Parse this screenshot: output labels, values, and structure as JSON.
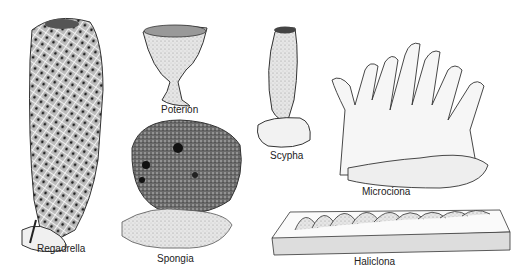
{
  "figure": {
    "specimens": [
      {
        "id": "regadrella",
        "label": "Regadrella"
      },
      {
        "id": "poterion",
        "label": "Poterion"
      },
      {
        "id": "spongia",
        "label": "Spongia"
      },
      {
        "id": "scypha",
        "label": "Scypha"
      },
      {
        "id": "microciona",
        "label": "Microciona"
      },
      {
        "id": "haliclona",
        "label": "Haliclona"
      }
    ]
  }
}
